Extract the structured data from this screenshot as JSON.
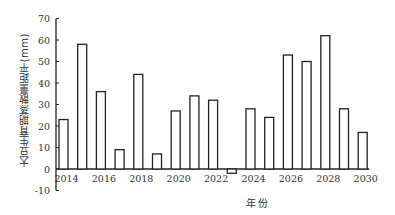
{
  "chart_data": {
    "type": "bar",
    "title": "",
    "xlabel": "年份",
    "ylabel": "大豆生育期蒸散量距平(mm)",
    "categories": [
      "2014",
      "2015",
      "2016",
      "2017",
      "2018",
      "2019",
      "2020",
      "2021",
      "2022",
      "2023",
      "2024",
      "2025",
      "2026",
      "2027",
      "2028",
      "2029",
      "2030"
    ],
    "values": [
      23,
      58,
      36,
      9,
      44,
      7,
      27,
      34,
      32,
      -2,
      28,
      24,
      53,
      50,
      62,
      28,
      17
    ],
    "xtick_labels": [
      "2014",
      "2016",
      "2018",
      "2020",
      "2022",
      "2024",
      "2026",
      "2028",
      "2030"
    ],
    "yticks": [
      -10,
      0,
      10,
      20,
      30,
      40,
      50,
      60,
      70
    ],
    "ylim": [
      -10,
      70
    ],
    "grid": false,
    "legend": null,
    "bar_fill": "#ffffff",
    "bar_stroke": "#222222"
  }
}
